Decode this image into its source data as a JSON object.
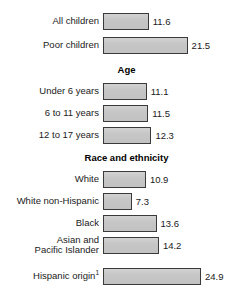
{
  "chart_data": {
    "type": "bar",
    "orientation": "horizontal",
    "title": "",
    "xlabel": "",
    "ylabel": "",
    "xlim": [
      0,
      25
    ],
    "grid": false,
    "legend": false,
    "bar_color": "#c9c9c9",
    "bar_border_color": "#3a3a3a",
    "groups": [
      {
        "header": "",
        "rows": [
          {
            "label": "All children",
            "value": 11.6,
            "value_label": "11.6"
          },
          {
            "label": "Poor children",
            "value": 21.5,
            "value_label": "21.5"
          }
        ]
      },
      {
        "header": "Age",
        "rows": [
          {
            "label": "Under 6 years",
            "value": 11.1,
            "value_label": "11.1"
          },
          {
            "label": "6 to 11 years",
            "value": 11.5,
            "value_label": "11.5"
          },
          {
            "label": "12 to 17 years",
            "value": 12.3,
            "value_label": "12.3"
          }
        ]
      },
      {
        "header": "Race and ethnicity",
        "rows": [
          {
            "label": "White",
            "value": 10.9,
            "value_label": "10.9"
          },
          {
            "label": "White non-Hispanic",
            "value": 7.3,
            "value_label": "7.3"
          },
          {
            "label": "Black",
            "value": 13.6,
            "value_label": "13.6"
          },
          {
            "label": "Asian and\nPacific Islander",
            "value": 14.2,
            "value_label": "14.2"
          },
          {
            "label": "Hispanic origin",
            "label_superscript": "1",
            "value": 24.9,
            "value_label": "24.9"
          }
        ]
      }
    ],
    "categories": [
      "All children",
      "Poor children",
      "Under 6 years",
      "6 to 11 years",
      "12 to 17 years",
      "White",
      "White non-Hispanic",
      "Black",
      "Asian and Pacific Islander",
      "Hispanic origin"
    ],
    "values": [
      11.6,
      21.5,
      11.1,
      11.5,
      12.3,
      10.9,
      7.3,
      13.6,
      14.2,
      24.9
    ]
  }
}
